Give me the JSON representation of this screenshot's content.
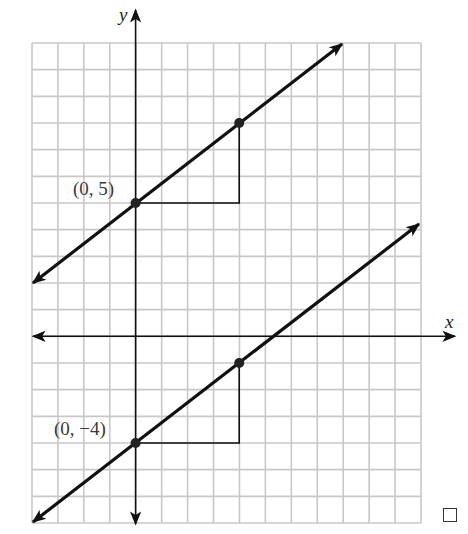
{
  "chart_data": {
    "type": "line",
    "title": "",
    "xlabel": "x",
    "ylabel": "y",
    "xlim": [
      -4,
      11
    ],
    "ylim": [
      -7,
      11
    ],
    "grid": true,
    "series": [
      {
        "name": "line through (0, 5)",
        "slope": 0.75,
        "intercept": 5,
        "marked_points": [
          [
            0,
            5
          ],
          [
            4,
            8
          ]
        ],
        "slope_triangle": {
          "run": 4,
          "rise": 3,
          "corner": [
            4,
            5
          ]
        },
        "segment": [
          [
            -4,
            2
          ],
          [
            8,
            11
          ]
        ]
      },
      {
        "name": "line through (0, -4)",
        "slope": 0.75,
        "intercept": -4,
        "marked_points": [
          [
            0,
            -4
          ],
          [
            4,
            -1
          ]
        ],
        "slope_triangle": {
          "run": 4,
          "rise": 3,
          "corner": [
            4,
            -4
          ]
        },
        "segment": [
          [
            -4,
            -7
          ],
          [
            11,
            4.25
          ]
        ]
      }
    ],
    "annotations": [
      "(0, 5)",
      "(0, −4)"
    ]
  },
  "labels": {
    "x_axis": "x",
    "y_axis": "y",
    "point_upper": "(0, 5)",
    "point_lower": "(0, −4)"
  },
  "colors": {
    "grid": "#c8c8c8",
    "line": "#111111",
    "text": "#3a3a3a"
  }
}
